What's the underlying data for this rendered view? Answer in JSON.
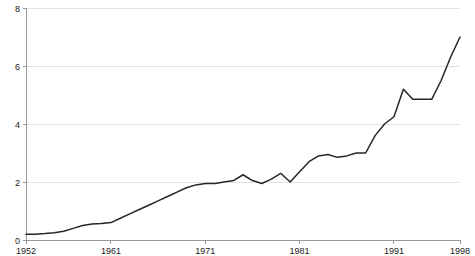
{
  "chart_data": {
    "type": "line",
    "title": "",
    "subtitle": "",
    "xlabel": "",
    "ylabel": "",
    "xlim": [
      1952,
      1998
    ],
    "ylim": [
      0,
      8
    ],
    "grid": true,
    "grid_axis": "y",
    "legend": false,
    "legend_position": "none",
    "x_tick_labels": [
      "1952",
      "1961",
      "1971",
      "1981",
      "1991",
      "1998"
    ],
    "x_tick_values": [
      1952,
      1961,
      1971,
      1981,
      1991,
      1998
    ],
    "y_tick_labels": [
      "0",
      "2",
      "4",
      "6",
      "8"
    ],
    "y_tick_values": [
      0,
      2,
      4,
      6,
      8
    ],
    "series": [
      {
        "name": "series-1",
        "color": "#262626",
        "x": [
          1952,
          1953,
          1954,
          1955,
          1956,
          1957,
          1958,
          1959,
          1960,
          1961,
          1962,
          1963,
          1964,
          1965,
          1966,
          1967,
          1968,
          1969,
          1970,
          1971,
          1972,
          1973,
          1974,
          1975,
          1976,
          1977,
          1978,
          1979,
          1980,
          1981,
          1982,
          1983,
          1984,
          1985,
          1986,
          1987,
          1988,
          1989,
          1990,
          1991,
          1992,
          1993,
          1994,
          1995,
          1996,
          1997,
          1998
        ],
        "values": [
          0.2,
          0.2,
          0.22,
          0.25,
          0.3,
          0.4,
          0.5,
          0.55,
          0.57,
          0.6,
          0.75,
          0.9,
          1.05,
          1.2,
          1.35,
          1.5,
          1.65,
          1.8,
          1.9,
          1.95,
          1.95,
          2.0,
          2.05,
          2.25,
          2.05,
          1.95,
          2.1,
          2.3,
          2.0,
          2.35,
          2.7,
          2.9,
          2.95,
          2.85,
          2.9,
          3.0,
          3.0,
          3.6,
          4.0,
          4.25,
          5.2,
          4.85,
          4.85,
          4.85,
          5.5,
          6.3,
          7.0
        ]
      }
    ]
  },
  "axes": {
    "y_axis_name": "y-axis",
    "x_axis_name": "x-axis"
  }
}
